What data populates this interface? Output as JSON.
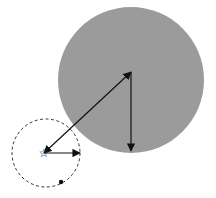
{
  "diagram": {
    "background": "#ffffff",
    "large_circle": {
      "cx": 131,
      "cy": 80,
      "r": 73,
      "fill": "#9b9b9b"
    },
    "center_point": {
      "x": 131,
      "y": 72
    },
    "dashed_circle": {
      "cx": 46,
      "cy": 153,
      "r": 34,
      "stroke": "#333333"
    },
    "star": {
      "x": 44,
      "y": 153,
      "glyph": "☆"
    },
    "small_dot": {
      "x": 61,
      "y": 182,
      "r": 2.2
    },
    "arrows": [
      {
        "name": "center-to-star",
        "x1": 131,
        "y1": 72,
        "x2": 44,
        "y2": 153,
        "double": true
      },
      {
        "name": "center-down-radius",
        "x1": 131,
        "y1": 72,
        "x2": 131,
        "y2": 151,
        "double": false
      },
      {
        "name": "star-right-radius",
        "x1": 44,
        "y1": 153,
        "x2": 80,
        "y2": 153,
        "double": false
      }
    ],
    "line_color": "#111111"
  }
}
